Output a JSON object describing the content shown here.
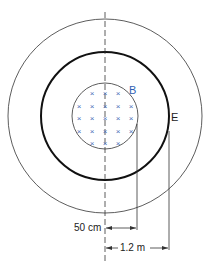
{
  "diagram": {
    "type": "concentric-circles-magnetic-field",
    "labels": {
      "field_label": "B",
      "ring_label": "E",
      "inner_radius": "50 cm",
      "outer_radius": "1.2 m"
    },
    "field_symbol": "×",
    "field_rows": [
      3,
      5,
      5,
      5,
      3
    ],
    "colors": {
      "field": "#4a6fb8",
      "label_b": "#2f5fb3",
      "lines": "#222222"
    }
  }
}
